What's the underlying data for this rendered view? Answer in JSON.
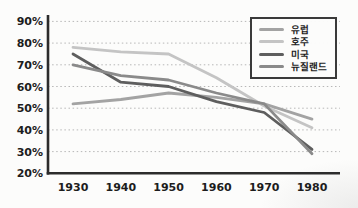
{
  "chart_data": {
    "type": "line",
    "title": "",
    "xlabel": "",
    "ylabel": "",
    "x": [
      "1930",
      "1940",
      "1950",
      "1960",
      "1970",
      "1980"
    ],
    "y_axis": {
      "min": 20,
      "max": 90,
      "step": 10,
      "suffix": "%"
    },
    "grid": "dotted-horizontal",
    "legend_position": "top-right",
    "series": [
      {
        "id": "europe",
        "name": "유럽",
        "color": "#a3a3a3",
        "values": [
          52,
          54,
          57,
          55,
          52,
          45
        ]
      },
      {
        "id": "australia",
        "name": "호주",
        "color": "#c4c4c4",
        "values": [
          78,
          76,
          75,
          64,
          51,
          41
        ]
      },
      {
        "id": "usa",
        "name": "미국",
        "color": "#5e5e5e",
        "values": [
          75,
          62,
          60,
          53,
          48,
          31
        ]
      },
      {
        "id": "new-zealand",
        "name": "뉴질랜드",
        "color": "#8a8a8a",
        "values": [
          70,
          65,
          63,
          57,
          52,
          29
        ]
      }
    ],
    "colors": {
      "axis": "#2c2c2c",
      "gridline": "#b7b7b7",
      "tick_text": "#1d1d1d",
      "legend_border": "#3a3a3a"
    }
  }
}
